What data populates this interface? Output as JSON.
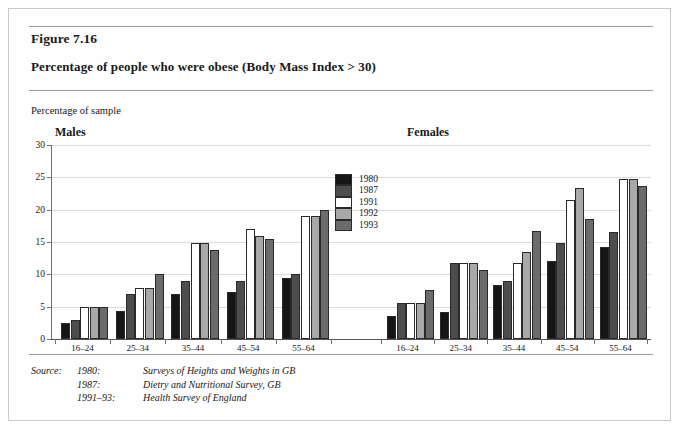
{
  "figure": {
    "number": "Figure 7.16",
    "title": "Percentage of people who were obese (Body Mass Index > 30)",
    "axis_caption": "Percentage of sample"
  },
  "panels": {
    "males": "Males",
    "females": "Females"
  },
  "source": {
    "lead": "Source:",
    "rows": [
      {
        "year": "1980:",
        "text": "Surveys of Heights and Weights in GB"
      },
      {
        "year": "1987:",
        "text": "Dietry and Nutritional Survey, GB"
      },
      {
        "year": "1991–93:",
        "text": "Health Survey of England"
      }
    ]
  },
  "chart_data": {
    "type": "bar",
    "title": "Percentage of people who were obese (Body Mass Index > 30)",
    "xlabel": "",
    "ylabel": "Percentage of sample",
    "ylim": [
      0,
      30
    ],
    "yticks": [
      0,
      5,
      10,
      15,
      20,
      25,
      30
    ],
    "ytick_labels": [
      "0",
      "5",
      "10",
      "15",
      "20",
      "25",
      "30"
    ],
    "grid": true,
    "legend_position": "center",
    "categories": [
      "16–24",
      "25–34",
      "35–44",
      "45–54",
      "55–64"
    ],
    "series_names": [
      "1980",
      "1987",
      "1991",
      "1992",
      "1993"
    ],
    "series_colors": [
      "#151515",
      "#4d4d4d",
      "#ffffff",
      "#a8a8a8",
      "#6b6b6b"
    ],
    "panels": [
      {
        "name": "Males",
        "series": [
          {
            "name": "1980",
            "color": "#151515",
            "values": [
              2.5,
              4.4,
              6.9,
              7.2,
              9.4
            ]
          },
          {
            "name": "1987",
            "color": "#4d4d4d",
            "values": [
              3.0,
              6.9,
              8.9,
              8.9,
              10.0
            ]
          },
          {
            "name": "1991",
            "color": "#ffffff",
            "values": [
              5.0,
              7.9,
              14.9,
              17.0,
              19.0
            ]
          },
          {
            "name": "1992",
            "color": "#a8a8a8",
            "values": [
              5.0,
              7.9,
              14.9,
              16.0,
              19.0
            ]
          },
          {
            "name": "1993",
            "color": "#6b6b6b",
            "values": [
              5.0,
              10.0,
              13.8,
              15.5,
              20.0
            ]
          }
        ]
      },
      {
        "name": "Females",
        "series": [
          {
            "name": "1980",
            "color": "#151515",
            "values": [
              3.5,
              4.2,
              8.3,
              12.0,
              14.2
            ]
          },
          {
            "name": "1987",
            "color": "#4d4d4d",
            "values": [
              5.6,
              11.8,
              8.9,
              14.8,
              16.6
            ]
          },
          {
            "name": "1991",
            "color": "#ffffff",
            "values": [
              5.6,
              11.8,
              11.8,
              21.5,
              24.7
            ]
          },
          {
            "name": "1992",
            "color": "#a8a8a8",
            "values": [
              5.6,
              11.8,
              13.4,
              23.4,
              24.7
            ]
          },
          {
            "name": "1993",
            "color": "#6b6b6b",
            "values": [
              7.6,
              10.6,
              16.7,
              18.6,
              23.6
            ]
          }
        ]
      }
    ]
  }
}
